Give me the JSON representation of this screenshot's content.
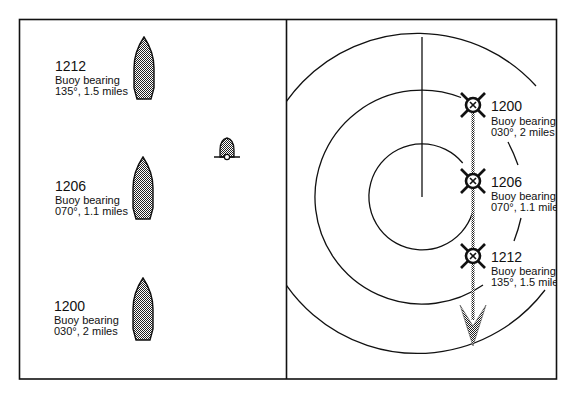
{
  "colors": {
    "ink": "#111111",
    "fill_grey": "#7a7a7a",
    "background": "#ffffff"
  },
  "left_panel": {
    "name": "relative-motion-view",
    "boats": [
      {
        "time": "1212",
        "line1": "Buoy bearing",
        "line2": "135°, 1.5 miles"
      },
      {
        "time": "1206",
        "line1": "Buoy bearing",
        "line2": "070°, 1.1 miles"
      },
      {
        "time": "1200",
        "line1": "Buoy bearing",
        "line2": "030°, 2 miles"
      }
    ],
    "buoy_symbol": "bell-buoy-icon"
  },
  "right_panel": {
    "name": "radar-plot-view",
    "range_rings": 3,
    "plots": [
      {
        "time": "1200",
        "line1": "Buoy bearing",
        "line2": "030°, 2 miles"
      },
      {
        "time": "1206",
        "line1": "Buoy bearing",
        "line2": "070°, 1.1 miles"
      },
      {
        "time": "1212",
        "line1": "Buoy bearing",
        "line2": "135°, 1.5 miles"
      }
    ],
    "track_arrow": "relative-motion-arrow"
  }
}
